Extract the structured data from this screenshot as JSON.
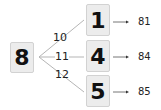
{
  "root": {
    "value": "8"
  },
  "branches": [
    {
      "edge_label": "10",
      "digit": "1",
      "result": "81"
    },
    {
      "edge_label": "11",
      "digit": "4",
      "result": "84"
    },
    {
      "edge_label": "12",
      "digit": "5",
      "result": "85"
    }
  ],
  "colors": {
    "box_fill": "#ececec",
    "box_border": "#d2d2d2",
    "line": "#b5b5b5",
    "arrow": "#555555"
  }
}
